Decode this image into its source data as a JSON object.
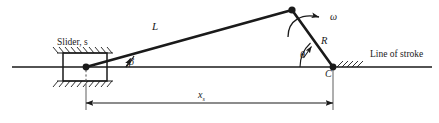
{
  "diagram": {
    "labels": {
      "slider": "Slider, s",
      "connecting_rod": "L",
      "beta_angle": "β",
      "omega": "ω",
      "crank_radius": "R",
      "theta_angle": "θ",
      "crank_center": "C",
      "line_of_stroke": "Line of stroke",
      "dimension_x": "x",
      "dimension_x_subscript": "s"
    },
    "colors": {
      "stroke": "#1a1a1a",
      "link": "#1a1a1a",
      "background": "#ffffff",
      "thin_line": "#4d4d4d"
    },
    "geometry": {
      "slider_pivot": [
        86,
        67
      ],
      "crank_pin": [
        292,
        10
      ],
      "crank_center": [
        333,
        67
      ],
      "line_of_stroke_y": 67,
      "line_of_stroke_x_start": 12,
      "line_of_stroke_x_end": 432,
      "dimension_line_y": 103
    }
  }
}
